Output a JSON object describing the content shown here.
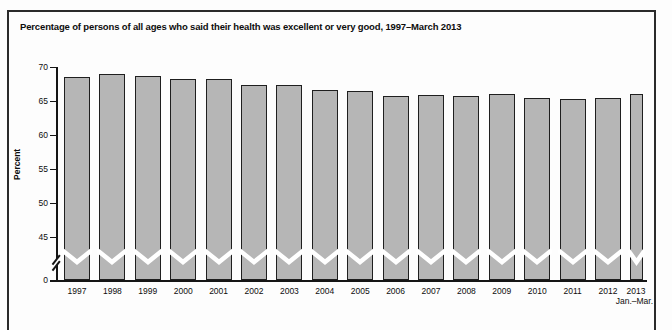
{
  "figure_label": "FIGURE 1.1",
  "chart_data": {
    "type": "bar",
    "title": "Percentage of persons of all ages who said their health was excellent or very good, 1997–March 2013",
    "xlabel": "",
    "ylabel": "Percent",
    "categories": [
      "1997",
      "1998",
      "1999",
      "2000",
      "2001",
      "2002",
      "2003",
      "2004",
      "2005",
      "2006",
      "2007",
      "2008",
      "2009",
      "2010",
      "2011",
      "2012",
      "2013"
    ],
    "values": [
      68.5,
      69.0,
      68.7,
      68.2,
      68.3,
      67.3,
      67.4,
      66.6,
      66.5,
      65.8,
      65.9,
      65.8,
      66.0,
      65.4,
      65.3,
      65.4,
      66.1
    ],
    "last_category_sublabel": "Jan.–Mar.",
    "yticks": [
      0,
      45,
      50,
      55,
      60,
      65,
      70
    ],
    "ylim": [
      0,
      70
    ],
    "axis_break": true,
    "axis_break_between": [
      0,
      45
    ],
    "grid": false,
    "legend": null,
    "bar_color": "#b6b6b6",
    "bar_border_color": "#1f1f1f",
    "break_marker_color": "#ffffff"
  }
}
